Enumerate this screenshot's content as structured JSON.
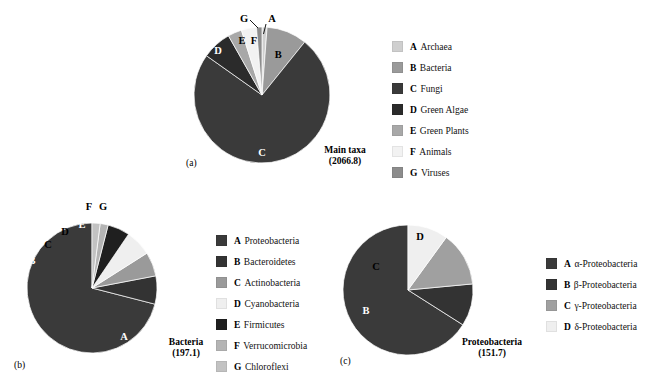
{
  "figure": {
    "background": "#ffffff",
    "palette": {
      "very_dark": "#2f2f2f",
      "dark": "#3a3a3a",
      "darkest": "#1f1f1f",
      "mid_gray": "#9a9a9a",
      "light_gray": "#b9b9b9",
      "lighter_gray": "#cfcfcf",
      "very_light": "#ededed",
      "near_white": "#f7f7f7"
    }
  },
  "chart_data": [
    {
      "id": "a",
      "type": "pie",
      "title": "Main taxa",
      "total_label": "(2066.8)",
      "total_value": 2066.8,
      "panel_label": "(a)",
      "start_angle": 0,
      "direction": "clockwise",
      "categories": [
        "A",
        "B",
        "C",
        "D",
        "E",
        "F",
        "G"
      ],
      "labels": [
        "Archaea",
        "Bacteria",
        "Fungi",
        "Green Algae",
        "Green Plants",
        "Animals",
        "Viruses"
      ],
      "values": [
        1.2,
        9.6,
        74.0,
        7.0,
        3.3,
        3.6,
        1.3
      ],
      "colors": [
        "#cfcfcf",
        "#9a9a9a",
        "#3a3a3a",
        "#2b2b2b",
        "#a8a8a8",
        "#f2f2f2",
        "#8c8c8c"
      ],
      "label_colors": [
        "dark",
        "dark",
        "light",
        "light",
        "dark",
        "dark",
        "dark"
      ]
    },
    {
      "id": "b",
      "type": "pie",
      "title": "Bacteria",
      "total_label": "(197.1)",
      "total_value": 197.1,
      "panel_label": "(b)",
      "start_angle": 0,
      "direction": "counterclockwise",
      "categories": [
        "A",
        "B",
        "C",
        "D",
        "E",
        "F",
        "G"
      ],
      "labels": [
        "Proteobacteria",
        "Bacteroidetes",
        "Actinobacteria",
        "Cyanobacteria",
        "Firmicutes",
        "Verrucomicrobia",
        "Chloroflexi"
      ],
      "values": [
        71.0,
        7.0,
        6.0,
        6.5,
        5.5,
        2.0,
        2.0
      ],
      "colors": [
        "#3a3a3a",
        "#333333",
        "#9a9a9a",
        "#efefef",
        "#1f1f1f",
        "#b4b4b4",
        "#c2c2c2"
      ],
      "label_colors": [
        "light",
        "light",
        "dark",
        "dark",
        "light",
        "dark",
        "dark"
      ]
    },
    {
      "id": "c",
      "type": "pie",
      "title": "Proteobacteria",
      "total_label": "(151.7)",
      "total_value": 151.7,
      "panel_label": "(c)",
      "start_angle": 0,
      "direction": "counterclockwise",
      "categories": [
        "A",
        "B",
        "C",
        "D"
      ],
      "labels": [
        "α-Proteobacteria",
        "β-Proteobacteria",
        "γ-Proteobacteria",
        "δ-Proteobacteria"
      ],
      "values": [
        66.0,
        10.5,
        13.5,
        10.0
      ],
      "colors": [
        "#3a3a3a",
        "#333333",
        "#a0a0a0",
        "#efefef"
      ],
      "label_colors": [
        "light",
        "light",
        "dark",
        "dark"
      ]
    }
  ],
  "panels": {
    "a": {
      "panel_label": "(a)",
      "caption_title": "Main taxa",
      "caption_total": "(2066.8)",
      "slice_labels": [
        "A",
        "B",
        "C",
        "D",
        "E",
        "F",
        "G"
      ]
    },
    "b": {
      "panel_label": "(b)",
      "caption_title": "Bacteria",
      "caption_total": "(197.1)",
      "slice_labels": [
        "A",
        "B",
        "C",
        "D",
        "E",
        "F",
        "G"
      ]
    },
    "c": {
      "panel_label": "(c)",
      "caption_title": "Proteobacteria",
      "caption_total": "(151.7)",
      "slice_labels": [
        "A",
        "B",
        "C",
        "D"
      ]
    }
  },
  "legends": {
    "a": [
      {
        "key": "A",
        "text": "Archaea",
        "color": "#cfcfcf"
      },
      {
        "key": "B",
        "text": "Bacteria",
        "color": "#9a9a9a"
      },
      {
        "key": "C",
        "text": "Fungi",
        "color": "#3a3a3a"
      },
      {
        "key": "D",
        "text": "Green Algae",
        "color": "#2b2b2b"
      },
      {
        "key": "E",
        "text": "Green Plants",
        "color": "#a8a8a8"
      },
      {
        "key": "F",
        "text": "Animals",
        "color": "#f2f2f2"
      },
      {
        "key": "G",
        "text": "Viruses",
        "color": "#8c8c8c"
      }
    ],
    "b": [
      {
        "key": "A",
        "text": "Proteobacteria",
        "color": "#3a3a3a"
      },
      {
        "key": "B",
        "text": "Bacteroidetes",
        "color": "#333333"
      },
      {
        "key": "C",
        "text": "Actinobacteria",
        "color": "#9a9a9a"
      },
      {
        "key": "D",
        "text": "Cyanobacteria",
        "color": "#efefef"
      },
      {
        "key": "E",
        "text": "Firmicutes",
        "color": "#1f1f1f"
      },
      {
        "key": "F",
        "text": "Verrucomicrobia",
        "color": "#b4b4b4"
      },
      {
        "key": "G",
        "text": "Chloroflexi",
        "color": "#c2c2c2"
      }
    ],
    "c": [
      {
        "key": "A",
        "text": "α-Proteobacteria",
        "color": "#3a3a3a"
      },
      {
        "key": "B",
        "text": "β-Proteobacteria",
        "color": "#333333"
      },
      {
        "key": "C",
        "text": "γ-Proteobacteria",
        "color": "#a0a0a0"
      },
      {
        "key": "D",
        "text": "δ-Proteobacteria",
        "color": "#efefef"
      }
    ]
  }
}
